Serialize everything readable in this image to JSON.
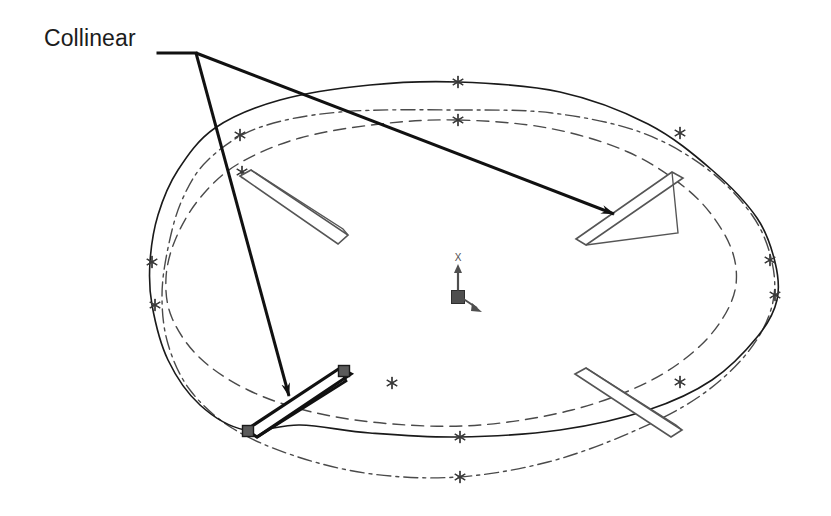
{
  "figure": {
    "background_color": "#ffffff",
    "width": 831,
    "height": 516
  },
  "annotation": {
    "label": "Collinear",
    "label_color": "#1c1c1c",
    "leader_color": "#111111",
    "leader_width": 3,
    "anchor_x": 158,
    "anchor_y": 53,
    "branch_x": 196,
    "branch_y": 53,
    "arrow_targets": [
      {
        "name": "upper-right-plate",
        "x": 614,
        "y": 214
      },
      {
        "name": "lower-left-plate",
        "x": 289,
        "y": 396
      }
    ]
  },
  "geometry": {
    "outer_spline": {
      "name": "outer-spline-curve",
      "style": "solid",
      "color": "#1a1a1a",
      "width": 1.6,
      "closed": true,
      "points": [
        [
          458,
          82
        ],
        [
          560,
          92
        ],
        [
          648,
          124
        ],
        [
          712,
          170
        ],
        [
          757,
          218
        ],
        [
          775,
          262
        ],
        [
          777,
          300
        ],
        [
          758,
          336
        ],
        [
          712,
          380
        ],
        [
          648,
          410
        ],
        [
          560,
          430
        ],
        [
          458,
          437
        ],
        [
          370,
          433
        ],
        [
          300,
          425
        ],
        [
          245,
          430
        ],
        [
          200,
          405
        ],
        [
          168,
          360
        ],
        [
          152,
          305
        ],
        [
          150,
          262
        ],
        [
          158,
          215
        ],
        [
          178,
          170
        ],
        [
          215,
          128
        ],
        [
          280,
          100
        ],
        [
          370,
          85
        ],
        [
          458,
          82
        ]
      ]
    },
    "dashdot_curve": {
      "name": "dash-dot-offset-curve",
      "style": "dash-dot",
      "color": "#4a4a4a",
      "width": 1.4,
      "dash_pattern": "14 5 3 5",
      "closed": true,
      "points": [
        [
          458,
          110
        ],
        [
          552,
          113
        ],
        [
          640,
          132
        ],
        [
          706,
          168
        ],
        [
          752,
          215
        ],
        [
          772,
          262
        ],
        [
          772,
          306
        ],
        [
          748,
          352
        ],
        [
          700,
          396
        ],
        [
          632,
          432
        ],
        [
          548,
          462
        ],
        [
          458,
          477
        ],
        [
          372,
          474
        ],
        [
          295,
          456
        ],
        [
          232,
          428
        ],
        [
          190,
          390
        ],
        [
          168,
          344
        ],
        [
          162,
          296
        ],
        [
          168,
          248
        ],
        [
          182,
          200
        ],
        [
          208,
          160
        ],
        [
          258,
          128
        ],
        [
          340,
          112
        ],
        [
          458,
          110
        ]
      ]
    },
    "inner_dashed_curve": {
      "name": "inner-dashed-curve",
      "style": "dashed",
      "color": "#4a4a4a",
      "width": 1.4,
      "dash_pattern": "12 7",
      "closed": true,
      "points": [
        [
          458,
          120
        ],
        [
          548,
          128
        ],
        [
          628,
          152
        ],
        [
          688,
          190
        ],
        [
          722,
          230
        ],
        [
          736,
          268
        ],
        [
          730,
          305
        ],
        [
          700,
          346
        ],
        [
          648,
          382
        ],
        [
          572,
          410
        ],
        [
          480,
          425
        ],
        [
          392,
          424
        ],
        [
          312,
          412
        ],
        [
          248,
          390
        ],
        [
          200,
          358
        ],
        [
          172,
          318
        ],
        [
          166,
          278
        ],
        [
          176,
          238
        ],
        [
          200,
          198
        ],
        [
          238,
          164
        ],
        [
          300,
          138
        ],
        [
          380,
          124
        ],
        [
          458,
          120
        ]
      ]
    },
    "star_markers": {
      "name": "spline-control-point",
      "color": "#3a3a3a",
      "size": 11,
      "points": [
        [
          458,
          82
        ],
        [
          680,
          133
        ],
        [
          770,
          260
        ],
        [
          775,
          295
        ],
        [
          242,
          172
        ],
        [
          152,
          262
        ],
        [
          155,
          305
        ],
        [
          460,
          437
        ],
        [
          240,
          135
        ],
        [
          458,
          120
        ],
        [
          392,
          383
        ],
        [
          680,
          382
        ],
        [
          460,
          477
        ]
      ]
    }
  },
  "plates": [
    {
      "name": "plate-upper-left",
      "selected": false,
      "stroke": "#555555",
      "fill": "#ffffff",
      "width": 1.6,
      "outline": [
        [
          240,
          176
        ],
        [
          251,
          170
        ],
        [
          348,
          235
        ],
        [
          338,
          244
        ]
      ],
      "edge": [
        [
          251,
          170
        ],
        [
          343,
          229
        ],
        [
          348,
          235
        ]
      ]
    },
    {
      "name": "plate-upper-right",
      "selected": false,
      "stroke": "#555555",
      "fill": "#ffffff",
      "width": 1.6,
      "outline": [
        [
          576,
          239
        ],
        [
          672,
          172
        ],
        [
          683,
          178
        ],
        [
          586,
          245
        ]
      ],
      "edge": [
        [
          672,
          172
        ],
        [
          678,
          233
        ],
        [
          586,
          245
        ]
      ]
    },
    {
      "name": "plate-lower-right",
      "selected": false,
      "stroke": "#555555",
      "fill": "#ffffff",
      "width": 1.6,
      "outline": [
        [
          575,
          374
        ],
        [
          586,
          368
        ],
        [
          682,
          430
        ],
        [
          671,
          437
        ]
      ],
      "edge": [
        [
          586,
          368
        ],
        [
          676,
          425
        ],
        [
          682,
          430
        ]
      ]
    },
    {
      "name": "plate-lower-left-selected",
      "selected": true,
      "stroke": "#111111",
      "fill": "#ffffff",
      "width": 3.2,
      "outline": [
        [
          246,
          430
        ],
        [
          340,
          368
        ],
        [
          351,
          374
        ],
        [
          257,
          437
        ]
      ],
      "edge": [
        [
          340,
          368
        ],
        [
          346,
          381
        ],
        [
          257,
          437
        ]
      ]
    }
  ],
  "selection_handles": {
    "name": "selection-handle",
    "fill": "#5a5a5a",
    "stroke": "#1a1a1a",
    "size": 11,
    "points": [
      [
        344,
        371
      ],
      [
        248,
        431
      ]
    ]
  },
  "origin_triad": {
    "name": "origin-triad",
    "color": "#4f4f4f",
    "square_x": 458,
    "square_y": 297,
    "square_size": 13,
    "axis_label": "X",
    "axis_tip_x": 458,
    "axis_tip_y": 262,
    "diag_tip_x": 482,
    "diag_tip_y": 312
  }
}
